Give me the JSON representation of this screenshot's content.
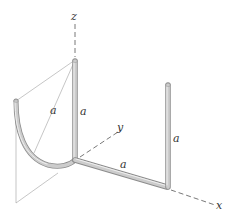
{
  "figure": {
    "type": "3D wire frame diagram",
    "axes": {
      "z": {
        "label": "z"
      },
      "y": {
        "label": "y"
      },
      "x": {
        "label": "x"
      }
    },
    "segment_labels": [
      {
        "id": "arc_chord",
        "text": "a"
      },
      {
        "id": "vertical_post_left",
        "text": "a"
      },
      {
        "id": "horizontal_x",
        "text": "a"
      },
      {
        "id": "vertical_post_right",
        "text": "a"
      }
    ],
    "colors": {
      "rod_fill": "#c8c8c8",
      "rod_edge": "#8c8c8c",
      "rod_highlight": "#eeeeee",
      "axis_dash": "#555555",
      "construction_line": "#9a9a9a"
    }
  }
}
